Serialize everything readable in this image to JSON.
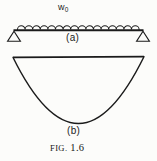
{
  "figure": {
    "caption_prefix": "FIG.",
    "caption_number": "1.6",
    "caption_full": "FIG. 1.6",
    "background_color": "#fcfcfa",
    "ink_color": "#1b1b1b"
  },
  "panel_a": {
    "label": "(a)",
    "load_symbol": "w",
    "load_subscript": "0",
    "load_label_full": "w0",
    "description_parts": {
      "beam": "simply-supported-beam",
      "left_support": "triangle-pin-support",
      "right_support": "triangle-roller-support",
      "distributed_load": "scalloped-uniform-load"
    },
    "scallop_count": 17,
    "beam": {
      "x_start": 14,
      "x_end": 143,
      "y": 30
    },
    "supports": [
      {
        "name": "left",
        "apex_x": 14,
        "apex_y": 30,
        "half_width": 7,
        "height": 10
      },
      {
        "name": "right",
        "apex_x": 143,
        "apex_y": 30,
        "half_width": 7,
        "height": 10
      }
    ]
  },
  "panel_b": {
    "label": "(b)",
    "description": "parabolic-bending-moment-diagram",
    "chord": {
      "x_start": 13,
      "x_end": 144,
      "y": 57
    },
    "vertex": {
      "x": 78,
      "y": 123
    }
  }
}
